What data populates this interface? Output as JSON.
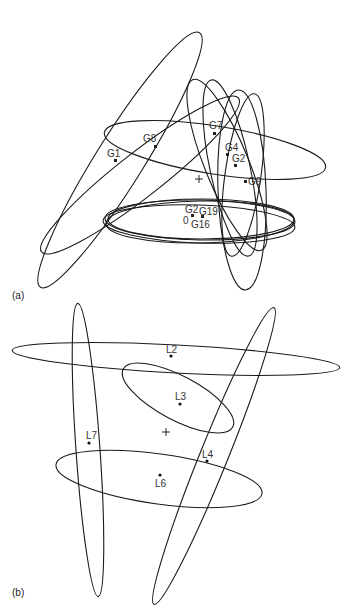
{
  "panels": [
    {
      "id": "a",
      "label": "(a)",
      "center_marker": "+",
      "points": [
        {
          "name": "G1",
          "x": 115,
          "y": 160
        },
        {
          "name": "G8",
          "x": 155,
          "y": 146
        },
        {
          "name": "G7",
          "x": 214,
          "y": 133
        },
        {
          "name": "G4",
          "x": 227,
          "y": 154
        },
        {
          "name": "G2",
          "x": 235,
          "y": 165
        },
        {
          "name": "G9",
          "x": 245,
          "y": 181
        },
        {
          "name": "G2",
          "x": 192,
          "y": 215
        },
        {
          "name": "0",
          "x": 195,
          "y": 217
        },
        {
          "name": "G19",
          "x": 202,
          "y": 216
        },
        {
          "name": "G16",
          "x": 196,
          "y": 218
        }
      ]
    },
    {
      "id": "b",
      "label": "(b)",
      "center_marker": "+",
      "points": [
        {
          "name": "L2",
          "x": 171,
          "y": 356
        },
        {
          "name": "L3",
          "x": 180,
          "y": 404
        },
        {
          "name": "L7",
          "x": 89,
          "y": 443
        },
        {
          "name": "L4",
          "x": 207,
          "y": 461
        },
        {
          "name": "L6",
          "x": 160,
          "y": 475
        }
      ]
    }
  ]
}
